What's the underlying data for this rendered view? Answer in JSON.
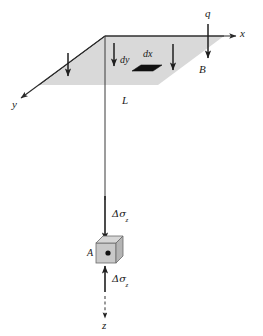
{
  "figure": {
    "background_color": "#ffffff",
    "plane_fill": "#d8d8d8",
    "line_color": "#333333",
    "element_fill": "#111111",
    "cube_fill": "#c9c9c9"
  },
  "axes": {
    "x": {
      "label": "x",
      "direction": "right"
    },
    "y": {
      "label": "y",
      "direction": "lower-left"
    },
    "z": {
      "label": "z",
      "direction": "down",
      "style": "dashed"
    }
  },
  "labels": {
    "load": "q",
    "area": "B",
    "depth": "L",
    "point": "A",
    "element_dx": "dx",
    "element_dy": "dy",
    "stress_top": "Δσ",
    "stress_top_sub": "z",
    "stress_bottom": "Δσ",
    "stress_bottom_sub": "z"
  },
  "arrows": {
    "load_arrows_count": 4,
    "load_arrow_labels": [
      "load-arrow-left",
      "load-arrow-dy",
      "load-arrow-middle",
      "load-arrow-q"
    ],
    "stress_arrow_down": "down",
    "stress_arrow_up": "up"
  }
}
